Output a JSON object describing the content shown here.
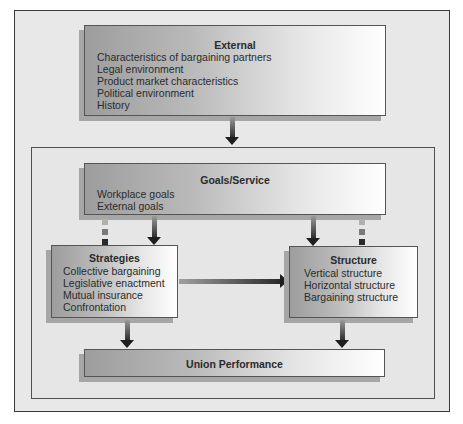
{
  "diagram": {
    "external": {
      "title": "External",
      "items": [
        "Characteristics of bargaining partners",
        "Legal environment",
        "Product market characteristics",
        "Political environment",
        "History"
      ]
    },
    "goals": {
      "title": "Goals/Service",
      "items": [
        "Workplace goals",
        "External goals"
      ]
    },
    "strategies": {
      "title": "Strategies",
      "items": [
        "Collective bargaining",
        "Legislative enactment",
        "Mutual insurance",
        "Confrontation"
      ]
    },
    "structure": {
      "title": "Structure",
      "items": [
        "Vertical structure",
        "Horizontal structure",
        "Bargaining structure"
      ]
    },
    "performance": {
      "title": "Union Performance"
    },
    "connections": [
      {
        "from": "External",
        "to": "Inner framework",
        "type": "arrow"
      },
      {
        "from": "Goals/Service",
        "to": "Strategies",
        "type": "arrow"
      },
      {
        "from": "Goals/Service",
        "to": "Strategies",
        "type": "dashed"
      },
      {
        "from": "Goals/Service",
        "to": "Structure",
        "type": "arrow"
      },
      {
        "from": "Goals/Service",
        "to": "Structure",
        "type": "dashed"
      },
      {
        "from": "Strategies",
        "to": "Structure",
        "type": "arrow"
      },
      {
        "from": "Strategies",
        "to": "Union Performance",
        "type": "arrow"
      },
      {
        "from": "Structure",
        "to": "Union Performance",
        "type": "arrow"
      }
    ]
  }
}
